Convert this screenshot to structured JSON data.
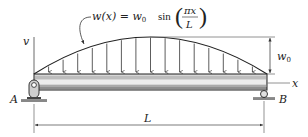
{
  "diagram": {
    "type": "simply-supported-beam-sinusoidal-load",
    "load_equation": {
      "lhs": "w(x) = w",
      "lhs_sub": "0",
      "func": "sin",
      "numerator": "πx",
      "denominator": "L"
    },
    "labels": {
      "vertical_axis": "v",
      "horizontal_axis": "x",
      "amplitude": "w",
      "amplitude_sub": "0",
      "support_left": "A",
      "support_right": "B",
      "span": "L"
    },
    "supports": {
      "left": "pin",
      "right": "roller"
    },
    "geometry": {
      "beam_x_start": 34,
      "beam_x_end": 267,
      "beam_top": 73,
      "beam_bottom": 90,
      "load_peak_y": 37,
      "arrow_count": 15
    },
    "colors": {
      "line": "#222222",
      "beam_fill": "#d9d9d9",
      "beam_stripe": "#ececec",
      "dimension_line": "#555555"
    }
  }
}
